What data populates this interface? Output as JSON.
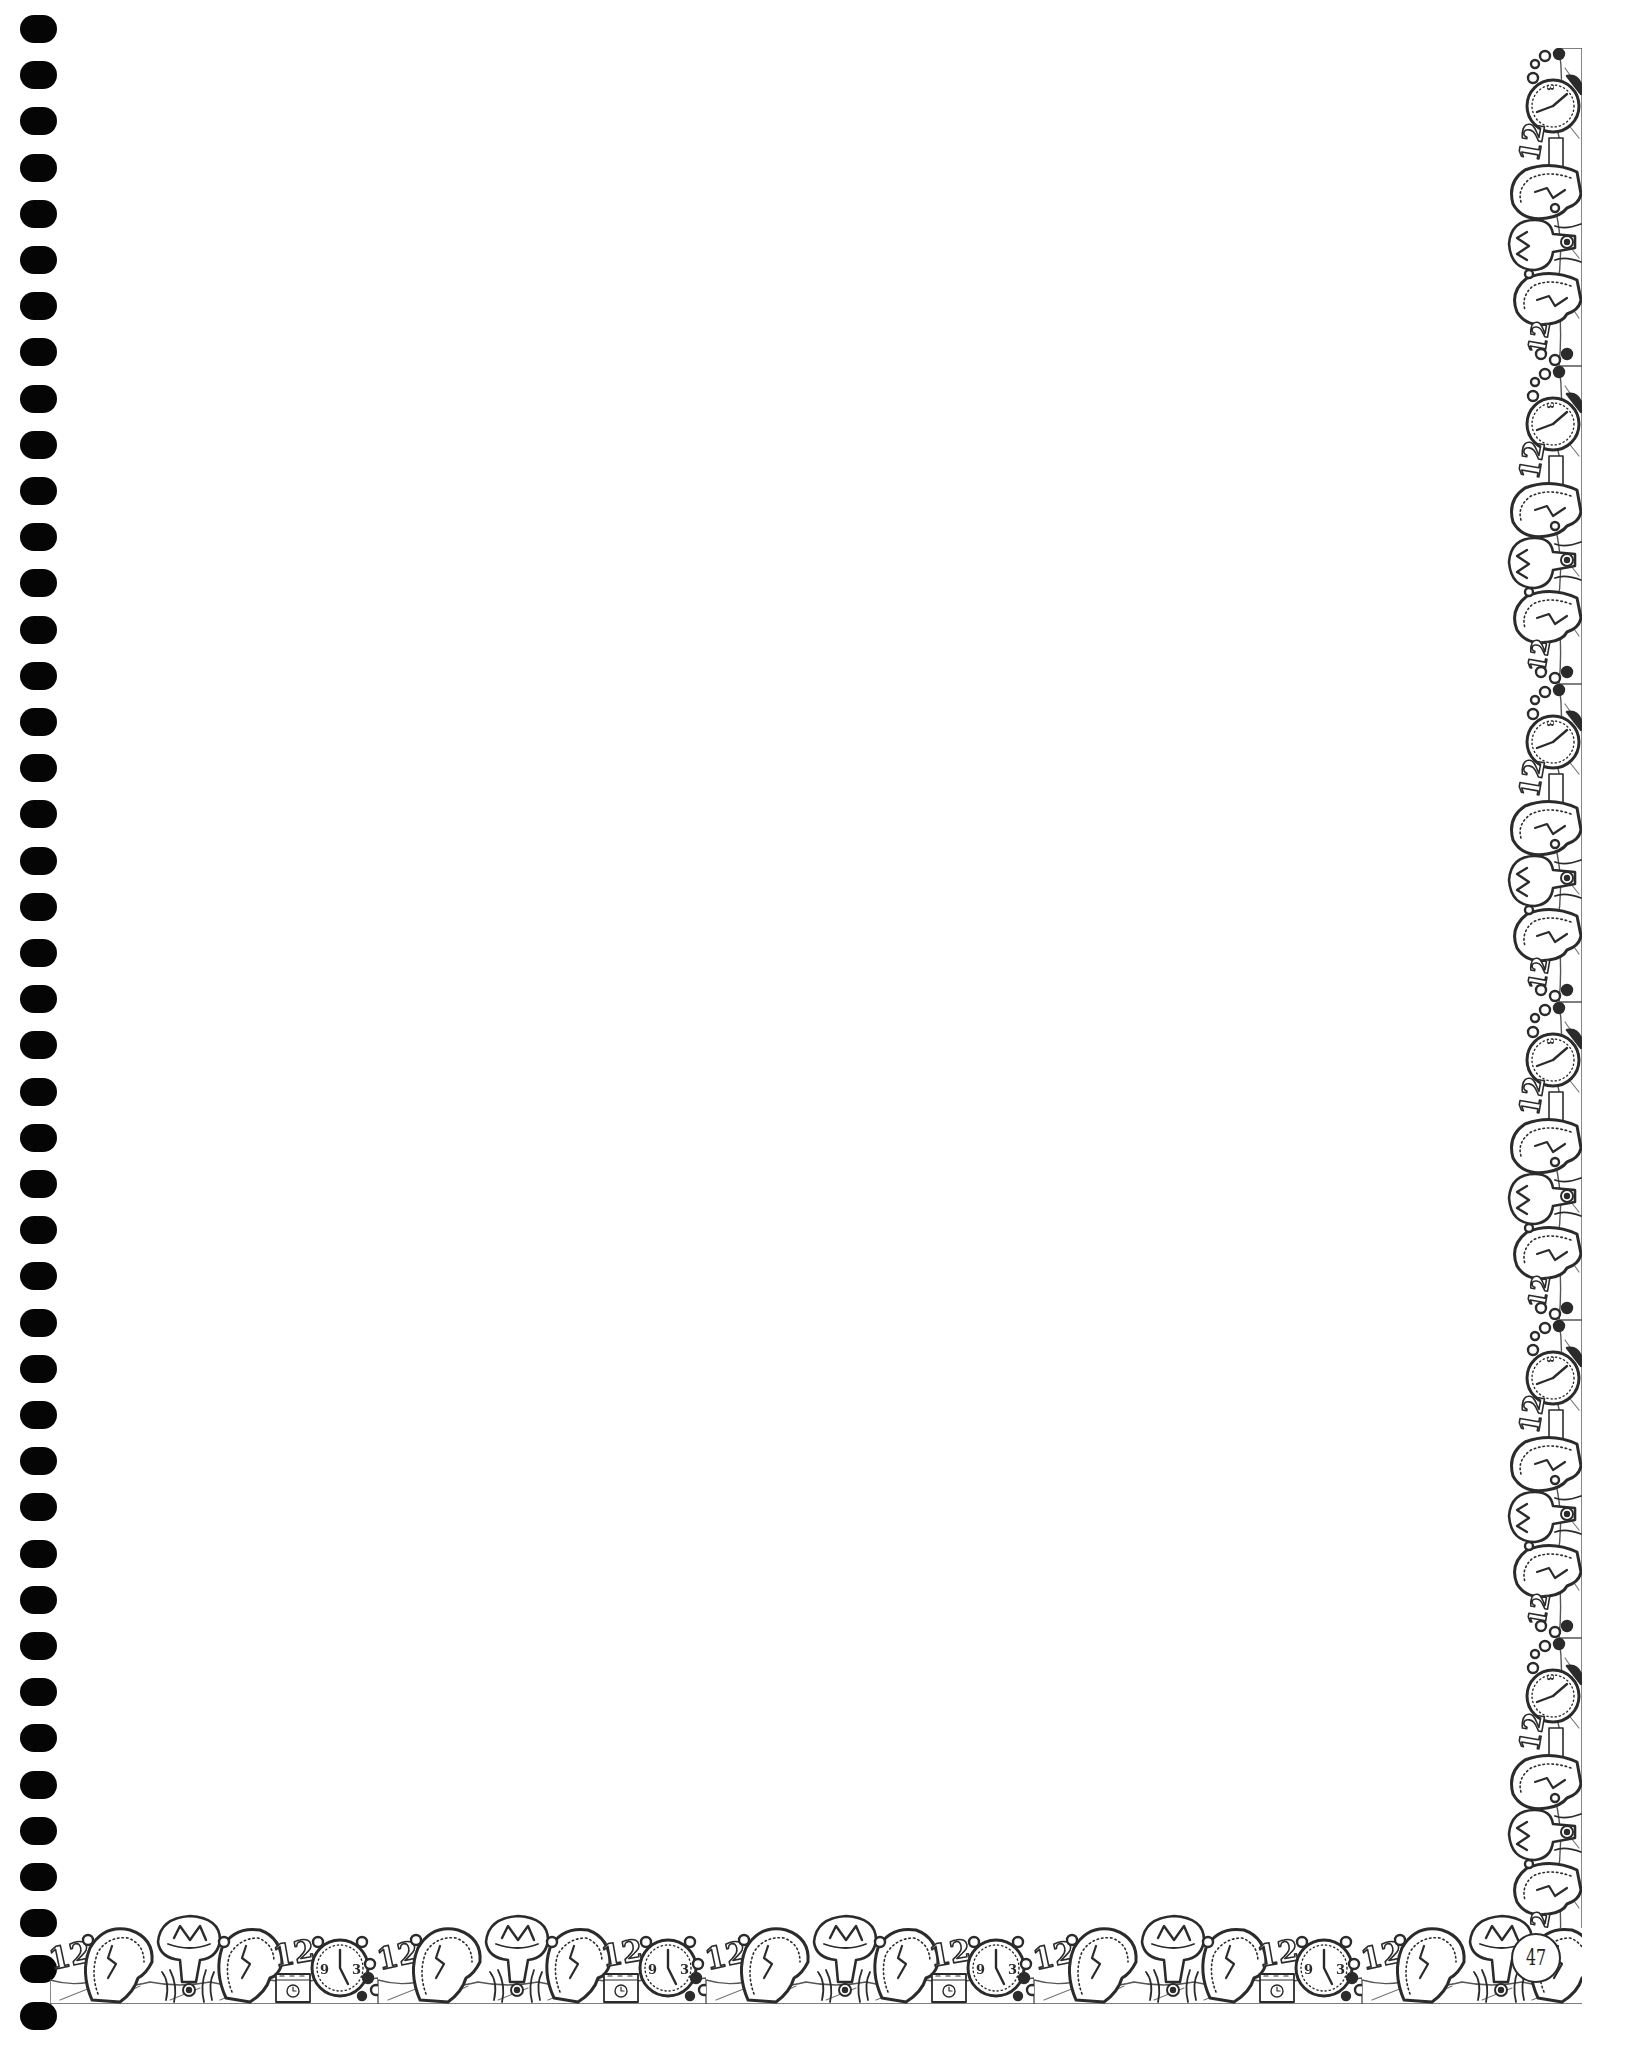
{
  "page": {
    "background_color": "#ffffff",
    "ink_color": "#2b2b2b",
    "hole_color": "#050505",
    "page_number": "47"
  },
  "binder": {
    "hole_count": 44,
    "hole_spacing_px": 46.2
  },
  "border": {
    "theme": "melting-clocks",
    "bottom_motifs": [
      "number-12",
      "melting-clock",
      "drooping-clock-3",
      "melting-clock",
      "number-12",
      "calendar-box",
      "alarm-clock",
      "beads"
    ],
    "right_motifs": [
      "alarm-clock",
      "number-12",
      "melting-clock",
      "drooping-clock-3",
      "melting-clock",
      "number-12",
      "beads"
    ],
    "alarm_clock_face": {
      "left": "9",
      "right": "3"
    }
  }
}
